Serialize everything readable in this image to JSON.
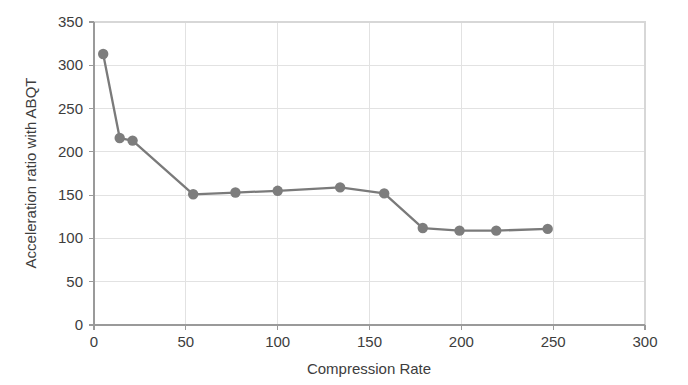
{
  "chart_data": {
    "type": "line",
    "title": "",
    "xlabel": "Compression Rate",
    "ylabel": "Acceleration ratio with ABQT",
    "xlim": [
      0,
      300
    ],
    "ylim": [
      0,
      350
    ],
    "xticks": [
      0,
      50,
      100,
      150,
      200,
      250,
      300
    ],
    "yticks": [
      0,
      50,
      100,
      150,
      200,
      250,
      300,
      350
    ],
    "xtick_labels": [
      "0",
      "50",
      "100",
      "150",
      "200",
      "250",
      "300"
    ],
    "ytick_labels": [
      "0",
      "50",
      "100",
      "150",
      "200",
      "250",
      "300",
      "350"
    ],
    "grid": true,
    "legend": null,
    "series": [
      {
        "name": "Acceleration ratio with ABQT",
        "color": "#7d7d7d",
        "marker": "circle",
        "x": [
          5,
          14,
          21,
          54,
          77,
          100,
          134,
          158,
          179,
          199,
          219,
          247
        ],
        "y": [
          313,
          216,
          213,
          151,
          153,
          155,
          159,
          152,
          112,
          109,
          109,
          111
        ]
      }
    ]
  },
  "style": {
    "line_color": "#7a7a7a",
    "marker_color": "#7d7d7d",
    "grid_color": "#e2e2e2",
    "axis_color": "#9a9a9a",
    "text_color": "#3d3d3d",
    "background": "#ffffff"
  }
}
